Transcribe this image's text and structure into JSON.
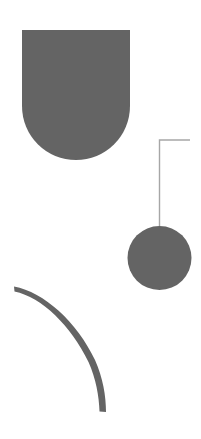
{
  "canvas": {
    "width": 201,
    "height": 439,
    "background_color": "#ffffff",
    "title": "Pendulum Shapes"
  },
  "palette": {
    "shape_fill": "#646464",
    "line_stroke": "#a6a6a6",
    "background": "#ffffff"
  },
  "shapes": {
    "arch": {
      "label": "Arch Shape",
      "kind": "rounded-bottom-rectangle",
      "fill": "#646464",
      "x": 22,
      "y": 30,
      "width": 108,
      "height": 130,
      "corner_radius": 54,
      "path": "M 22 30 L 130 30 L 130 106 A 54 54 0 0 1 22 106 Z"
    },
    "pendulum_rod": {
      "label": "Pendulum Rod",
      "kind": "polyline",
      "stroke": "#a6a6a6",
      "stroke_width": 1.4,
      "corner_x": 159.5,
      "corner_y": 140,
      "horizontal_end_x": 190,
      "vertical_end_y": 240,
      "path": "M 190 140 L 159.5 140 L 159.5 240"
    },
    "pendulum_bob": {
      "label": "Pendulum Bob",
      "kind": "circle",
      "fill": "#646464",
      "cx": 159.5,
      "cy": 258,
      "r": 32
    },
    "crescent_arc": {
      "label": "Crescent Arc",
      "kind": "tapered-arc",
      "fill": "#646464",
      "start_x": 14,
      "start_y": 287,
      "end_x": 104,
      "end_y": 412,
      "max_thickness": 7,
      "path": "M 14 286.5 C 44 292 77 322 95 360 C 103 378 106 396 106 412 L 99.5 411.5 C 99 396 96 379 88.5 362 C 71 326 42 297 14.5 291.5 Z"
    }
  }
}
